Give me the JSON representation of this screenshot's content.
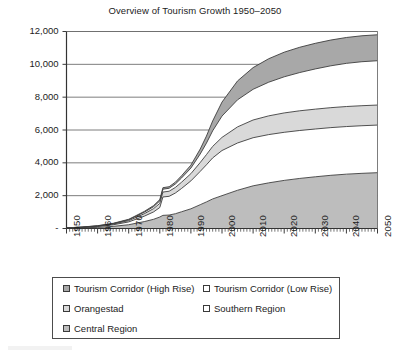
{
  "chart": {
    "title": "Overview of Tourism Growth 1950–2050",
    "ylabel": "Tourist Accommodation - Rooms",
    "xlabel": "",
    "zero_tick_label": "-"
  },
  "legend": {
    "items": [
      {
        "label": "Tourism Corridor (High Rise)",
        "color": "#a8a8a8",
        "swatch": "legend-swatch-tourism-corridor-high-rise"
      },
      {
        "label": "Tourism Corridor (Low Rise)",
        "color": "#ffffff",
        "swatch": "legend-swatch-tourism-corridor-low-rise"
      },
      {
        "label": "Orangestad",
        "color": "#d9d9d9",
        "swatch": "legend-swatch-orangestad"
      },
      {
        "label": "Southern Region",
        "color": "#ffffff",
        "swatch": "legend-swatch-southern-region"
      },
      {
        "label": "Central Region",
        "color": "#bdbdbd",
        "swatch": "legend-swatch-central-region"
      }
    ]
  },
  "chart_data": {
    "type": "area",
    "stacked": true,
    "title": "Overview of Tourism Growth 1950–2050",
    "xlabel": "",
    "ylabel": "Tourist Accommodation - Rooms",
    "xlim": [
      1950,
      2050
    ],
    "ylim": [
      0,
      12000
    ],
    "ytick_values": [
      0,
      2000,
      4000,
      6000,
      8000,
      10000,
      12000
    ],
    "ytick_labels": [
      "-",
      "2,000",
      "4,000",
      "6,000",
      "8,000",
      "10,000",
      "12,000"
    ],
    "xtick_labels": [
      "1950",
      "1960",
      "1970",
      "1980",
      "1990",
      "2000",
      "2010",
      "2020",
      "2030",
      "2040",
      "2050"
    ],
    "xtick_values": [
      1950,
      1960,
      1970,
      1980,
      1990,
      2000,
      2010,
      2020,
      2030,
      2040,
      2050
    ],
    "minor_xticks": "annual",
    "grid": "horizontal",
    "legend_position": "bottom",
    "x": [
      1950,
      1955,
      1960,
      1965,
      1970,
      1975,
      1978,
      1980,
      1981,
      1983,
      1985,
      1987,
      1990,
      1993,
      1995,
      1997,
      2000,
      2005,
      2010,
      2015,
      2020,
      2025,
      2030,
      2035,
      2040,
      2045,
      2050
    ],
    "series": [
      {
        "name": "Central Region",
        "color": "#bdbdbd",
        "values": [
          20,
          40,
          70,
          130,
          230,
          420,
          560,
          700,
          800,
          820,
          900,
          1020,
          1200,
          1450,
          1620,
          1800,
          2000,
          2330,
          2600,
          2780,
          2930,
          3050,
          3150,
          3240,
          3310,
          3360,
          3400
        ]
      },
      {
        "name": "Southern Region",
        "color": "#ffffff",
        "values": [
          10,
          25,
          50,
          95,
          170,
          330,
          450,
          580,
          1120,
          1140,
          1260,
          1420,
          1700,
          2030,
          2260,
          2500,
          2750,
          2880,
          2930,
          2940,
          2930,
          2920,
          2910,
          2905,
          2900,
          2900,
          2900
        ]
      },
      {
        "name": "Orangestad",
        "color": "#d9d9d9",
        "values": [
          5,
          12,
          25,
          45,
          80,
          150,
          200,
          250,
          300,
          310,
          340,
          380,
          440,
          540,
          620,
          700,
          800,
          980,
          1080,
          1140,
          1180,
          1200,
          1210,
          1215,
          1220,
          1220,
          1220
        ]
      },
      {
        "name": "Tourism Corridor (Low Rise)",
        "color": "#ffffff",
        "values": [
          3,
          8,
          15,
          28,
          50,
          90,
          120,
          150,
          175,
          180,
          210,
          260,
          340,
          520,
          700,
          950,
          1300,
          1650,
          1870,
          2050,
          2200,
          2330,
          2450,
          2550,
          2630,
          2680,
          2700
        ]
      },
      {
        "name": "Tourism Corridor (High Rise)",
        "color": "#a8a8a8",
        "values": [
          2,
          5,
          10,
          18,
          30,
          50,
          65,
          80,
          90,
          95,
          110,
          135,
          180,
          300,
          430,
          600,
          850,
          1150,
          1320,
          1430,
          1500,
          1540,
          1560,
          1570,
          1575,
          1580,
          1580
        ]
      }
    ],
    "totals_2050": {
      "Central Region": 3400,
      "Southern Region": 2900,
      "Orangestad": 1220,
      "Tourism Corridor (Low Rise)": 2700,
      "Tourism Corridor (High Rise)": 1580,
      "total": 11800
    }
  }
}
